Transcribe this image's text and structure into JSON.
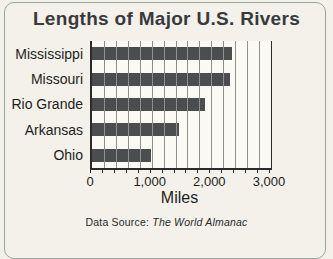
{
  "figure": {
    "title": "Lengths of Major U.S. Rivers",
    "x_axis_title": "Miles",
    "source_prefix": "Data Source: ",
    "source_name": "The World Almanac"
  },
  "chart_data": {
    "type": "bar",
    "orientation": "horizontal",
    "title": "Lengths of Major U.S. Rivers",
    "categories": [
      "Mississippi",
      "Missouri",
      "Rio Grande",
      "Arkansas",
      "Ohio"
    ],
    "values": [
      2340,
      2315,
      1900,
      1459,
      981
    ],
    "xlabel": "Miles",
    "ylabel": "",
    "xlim": [
      0,
      3000
    ],
    "xticks": [
      0,
      1000,
      2000,
      3000
    ],
    "xtick_labels": [
      "0",
      "1,000",
      "2,000",
      "3,000"
    ],
    "gridline_interval": 200,
    "grid": true,
    "legend": false,
    "annotation": "Data Source: The World Almanac"
  },
  "colors": {
    "panel_bg": "#f3f1ea",
    "plot_bg": "#fbf9f3",
    "bar_color": "#4c4d4f",
    "grid": "#8f8f8f",
    "axis": "#2b2b2b",
    "title_color": "#3a3a3c",
    "text": "#1e1e20",
    "frame_border": "#99a69c"
  }
}
